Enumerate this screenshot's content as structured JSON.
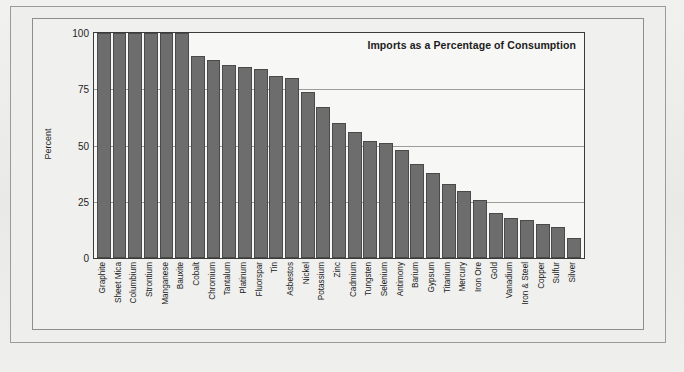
{
  "chart_data": {
    "type": "bar",
    "title": "Imports as a Percentage of Consumption",
    "xlabel": "",
    "ylabel": "Percent",
    "ylim": [
      0,
      100
    ],
    "yticks": [
      0,
      25,
      50,
      75,
      100
    ],
    "ytick_labels": [
      "0",
      "25",
      "50",
      "75",
      "100"
    ],
    "grid": true,
    "legend": "none",
    "orientation": "vertical",
    "bar_color": "#6d6d6d",
    "categories": [
      "Graphite",
      "Sheet Mica",
      "Columbium",
      "Strontium",
      "Manganese",
      "Bauxite",
      "Cobalt",
      "Chromium",
      "Tantalum",
      "Platinum",
      "Fluorspar",
      "Tin",
      "Asbestos",
      "Nickel",
      "Potassium",
      "Zinc",
      "Cadmium",
      "Tungsten",
      "Selenium",
      "Antimony",
      "Barium",
      "Gypsum",
      "Titanium",
      "Mercury",
      "Iron Ore",
      "Gold",
      "Vanadium",
      "Iron & Steel",
      "Copper",
      "Sulfur",
      "Silver"
    ],
    "values": [
      100,
      100,
      100,
      100,
      100,
      100,
      90,
      88,
      86,
      85,
      84,
      81,
      80,
      74,
      67,
      60,
      56,
      52,
      51,
      48,
      42,
      38,
      33,
      30,
      26,
      20,
      18,
      17,
      15,
      14,
      9
    ]
  },
  "figure": {
    "background_color": "#ececeb",
    "plot_background_color": "#f7f7f5",
    "axis_color": "#3a3a3a",
    "gridline_color": "#9c9c9a"
  }
}
